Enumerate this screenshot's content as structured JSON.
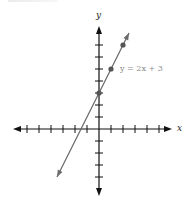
{
  "chart_data": {
    "type": "line",
    "title": "",
    "xlabel": "x",
    "ylabel": "y",
    "xlim": [
      -7,
      6
    ],
    "ylim": [
      -5,
      8
    ],
    "grid": false,
    "legend": null,
    "x_ticks": [
      -6,
      -5,
      -4,
      -3,
      -2,
      -1,
      1,
      2,
      3,
      4,
      5
    ],
    "y_ticks": [
      -4,
      -3,
      -2,
      -1,
      1,
      2,
      3,
      4,
      5,
      6,
      7
    ],
    "tick_labels_shown": false,
    "series": [
      {
        "name": "y = 2x + 3",
        "equation": "y = 2x + 3",
        "slope": 2,
        "intercept": 3,
        "line_extent_x": [
          -3.5,
          2.5
        ],
        "points": [
          {
            "x": 0,
            "y": 3
          },
          {
            "x": 1,
            "y": 5
          },
          {
            "x": 2,
            "y": 7
          }
        ]
      }
    ],
    "annotations": [
      {
        "text": "y = 2x + 3",
        "near": {
          "x": 1,
          "y": 5
        }
      }
    ]
  },
  "labels": {
    "x_axis": "x",
    "y_axis": "y",
    "equation": "y = 2x + 3"
  },
  "colors": {
    "axis": "#111111",
    "line": "#6b6b6b",
    "point": "#555555",
    "equation_text": "#8a8a8a"
  },
  "geometry": {
    "origin_px": [
      99,
      129
    ],
    "unit_px": 12
  }
}
